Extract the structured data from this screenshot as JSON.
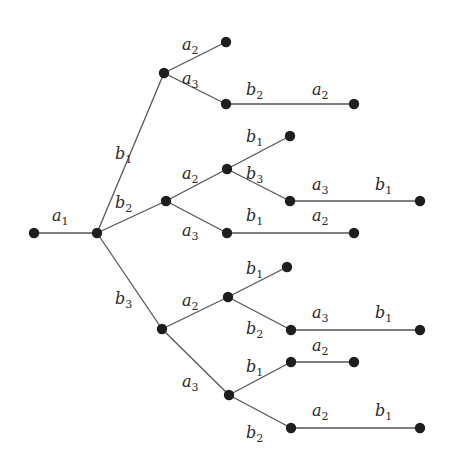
{
  "diagram": {
    "type": "tree",
    "nodes": [
      {
        "id": "r"
      },
      {
        "id": "n1"
      },
      {
        "id": "b1"
      },
      {
        "id": "b1a2"
      },
      {
        "id": "b1a3"
      },
      {
        "id": "b1a3b2"
      },
      {
        "id": "b2"
      },
      {
        "id": "b2a2"
      },
      {
        "id": "b2a2b1"
      },
      {
        "id": "b2a2b3"
      },
      {
        "id": "b2a2b3a3"
      },
      {
        "id": "b2a3"
      },
      {
        "id": "b2a3b1"
      },
      {
        "id": "b3"
      },
      {
        "id": "b3a2"
      },
      {
        "id": "b3a2b1"
      },
      {
        "id": "b3a2b2"
      },
      {
        "id": "b3a2b2a3"
      },
      {
        "id": "b3a3"
      },
      {
        "id": "b3a3b1"
      },
      {
        "id": "b3a3b1a2"
      },
      {
        "id": "b3a3b2"
      },
      {
        "id": "b3a3b2a2"
      }
    ],
    "edges": [
      {
        "from": "r",
        "to": "n1",
        "labels": [
          {
            "base": "a",
            "sub": "1"
          }
        ]
      },
      {
        "from": "n1",
        "to": "b1",
        "labels": [
          {
            "base": "b",
            "sub": "1"
          }
        ]
      },
      {
        "from": "b1",
        "to": "b1a2",
        "labels": [
          {
            "base": "a",
            "sub": "2"
          }
        ]
      },
      {
        "from": "b1",
        "to": "b1a3",
        "labels": [
          {
            "base": "a",
            "sub": "3"
          }
        ]
      },
      {
        "from": "b1a3",
        "to": "b1a3b2",
        "labels": [
          {
            "base": "b",
            "sub": "2"
          },
          {
            "base": "a",
            "sub": "2"
          }
        ]
      },
      {
        "from": "n1",
        "to": "b2",
        "labels": [
          {
            "base": "b",
            "sub": "2"
          }
        ]
      },
      {
        "from": "b2",
        "to": "b2a2",
        "labels": [
          {
            "base": "a",
            "sub": "2"
          }
        ]
      },
      {
        "from": "b2a2",
        "to": "b2a2b1",
        "labels": [
          {
            "base": "b",
            "sub": "1"
          }
        ]
      },
      {
        "from": "b2a2",
        "to": "b2a2b3",
        "labels": [
          {
            "base": "b",
            "sub": "3"
          }
        ]
      },
      {
        "from": "b2a2b3",
        "to": "b2a2b3a3",
        "labels": [
          {
            "base": "a",
            "sub": "3"
          },
          {
            "base": "b",
            "sub": "1"
          }
        ]
      },
      {
        "from": "b2",
        "to": "b2a3",
        "labels": [
          {
            "base": "a",
            "sub": "3"
          }
        ]
      },
      {
        "from": "b2a3",
        "to": "b2a3b1",
        "labels": [
          {
            "base": "b",
            "sub": "1"
          },
          {
            "base": "a",
            "sub": "2"
          }
        ]
      },
      {
        "from": "n1",
        "to": "b3",
        "labels": [
          {
            "base": "b",
            "sub": "3"
          }
        ]
      },
      {
        "from": "b3",
        "to": "b3a2",
        "labels": [
          {
            "base": "a",
            "sub": "2"
          }
        ]
      },
      {
        "from": "b3a2",
        "to": "b3a2b1",
        "labels": [
          {
            "base": "b",
            "sub": "1"
          }
        ]
      },
      {
        "from": "b3a2",
        "to": "b3a2b2",
        "labels": [
          {
            "base": "b",
            "sub": "2"
          }
        ]
      },
      {
        "from": "b3a2b2",
        "to": "b3a2b2a3",
        "labels": [
          {
            "base": "a",
            "sub": "3"
          },
          {
            "base": "b",
            "sub": "1"
          }
        ]
      },
      {
        "from": "b3",
        "to": "b3a3",
        "labels": [
          {
            "base": "a",
            "sub": "3"
          }
        ]
      },
      {
        "from": "b3a3",
        "to": "b3a3b1",
        "labels": [
          {
            "base": "b",
            "sub": "1"
          }
        ]
      },
      {
        "from": "b3a3b1",
        "to": "b3a3b1a2",
        "labels": [
          {
            "base": "a",
            "sub": "2"
          }
        ]
      },
      {
        "from": "b3a3",
        "to": "b3a3b2",
        "labels": [
          {
            "base": "b",
            "sub": "2"
          }
        ]
      },
      {
        "from": "b3a3b2",
        "to": "b3a3b2a2",
        "labels": [
          {
            "base": "a",
            "sub": "2"
          },
          {
            "base": "b",
            "sub": "1"
          }
        ]
      }
    ]
  }
}
